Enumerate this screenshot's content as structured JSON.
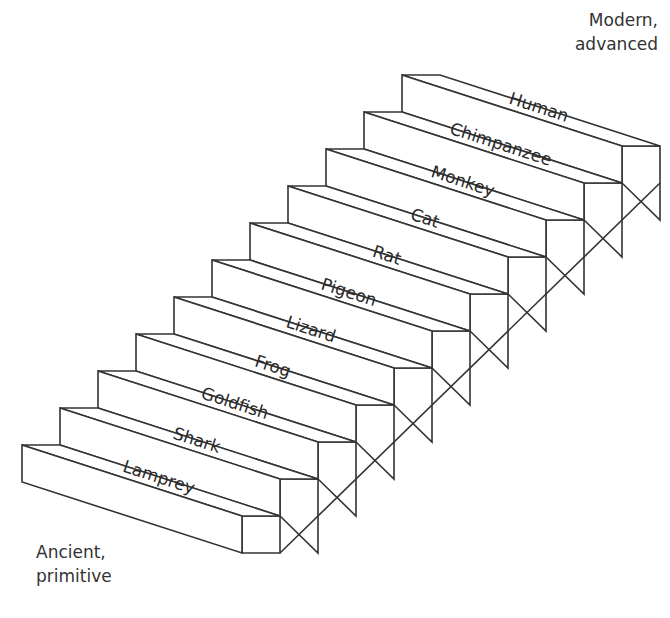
{
  "diagram": {
    "type": "staircase",
    "top_label": [
      "Modern,",
      "advanced"
    ],
    "bottom_label": [
      "Ancient,",
      "primitive"
    ],
    "steps": [
      {
        "label": "Lamprey"
      },
      {
        "label": "Shark"
      },
      {
        "label": "Goldfish"
      },
      {
        "label": "Frog"
      },
      {
        "label": "Lizard"
      },
      {
        "label": "Pigeon"
      },
      {
        "label": "Rat"
      },
      {
        "label": "Cat"
      },
      {
        "label": "Monkey"
      },
      {
        "label": "Chimpanzee"
      },
      {
        "label": "Human"
      }
    ],
    "colors": {
      "line": "#333333",
      "fill": "#ffffff",
      "text": "#2a2a2a"
    }
  }
}
